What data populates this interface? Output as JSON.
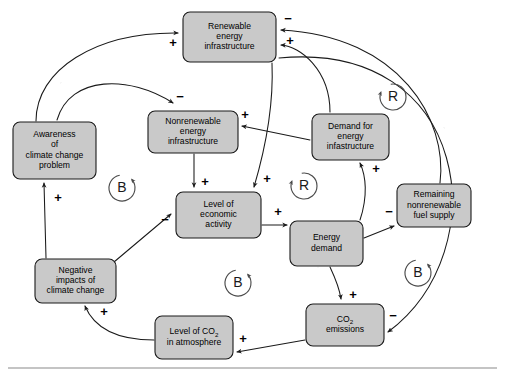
{
  "diagram": {
    "background_color": "#ffffff",
    "node_fill": "#c9c9c9",
    "node_stroke": "#1a1a1a",
    "link_color": "#1a1a1a",
    "loop_color": "#4a4a4a",
    "nodes": [
      {
        "id": "renewable",
        "lines": [
          "Renewable",
          "energy",
          "infrastructure"
        ],
        "x": 183,
        "y": 12,
        "w": 93,
        "h": 50
      },
      {
        "id": "awareness",
        "lines": [
          "Awareness",
          "of",
          "climate change",
          "problem"
        ],
        "x": 13,
        "y": 122,
        "w": 83,
        "h": 57
      },
      {
        "id": "nonrenewable",
        "lines": [
          "Nonrenewable",
          "energy",
          "infrastructure"
        ],
        "x": 148,
        "y": 111,
        "w": 90,
        "h": 42
      },
      {
        "id": "demand-infra",
        "lines": [
          "Demand for",
          "energy",
          "infastructure"
        ],
        "x": 312,
        "y": 114,
        "w": 77,
        "h": 46
      },
      {
        "id": "remaining-fuel",
        "lines": [
          "Remaining",
          "nonrenewable",
          "fuel supply"
        ],
        "x": 397,
        "y": 184,
        "w": 74,
        "h": 43
      },
      {
        "id": "economic",
        "lines": [
          "Level of",
          "economic",
          "activity"
        ],
        "x": 176,
        "y": 192,
        "w": 85,
        "h": 46
      },
      {
        "id": "energy-demand",
        "lines": [
          "Energy",
          "demand"
        ],
        "x": 290,
        "y": 221,
        "w": 73,
        "h": 45
      },
      {
        "id": "negative-impacts",
        "lines": [
          "Negative",
          "impacts of",
          "climate change"
        ],
        "x": 35,
        "y": 259,
        "w": 81,
        "h": 44
      },
      {
        "id": "co2-level",
        "lines": [
          "Level of CO|2|",
          "in atmosphere"
        ],
        "x": 155,
        "y": 316,
        "w": 78,
        "h": 43
      },
      {
        "id": "co2-emissions",
        "lines": [
          "CO|2|",
          "emissions"
        ],
        "x": 306,
        "y": 304,
        "w": 78,
        "h": 42
      }
    ],
    "links": [
      {
        "id": "awareness-to-renewable",
        "from": "awareness",
        "to": "renewable",
        "d": "M 36 121 C 36 70, 95 32, 178 33",
        "sign": "+",
        "sign_x": 173,
        "sign_y": 44
      },
      {
        "id": "awareness-to-nonrenewable",
        "from": "awareness",
        "to": "nonrenewable",
        "d": "M 57 120 C 70 75, 130 75, 173 103",
        "sign": "−",
        "sign_x": 180,
        "sign_y": 98
      },
      {
        "id": "nonrenewable-to-economic",
        "from": "nonrenewable",
        "to": "economic",
        "d": "M 194 154 L 194 187",
        "sign": "+",
        "sign_x": 205,
        "sign_y": 183
      },
      {
        "id": "renewable-to-economic",
        "from": "renewable",
        "to": "economic",
        "d": "M 272 63 C 274 110, 262 160, 254 187",
        "sign": "+",
        "sign_x": 267,
        "sign_y": 180
      },
      {
        "id": "economic-to-energydemand",
        "from": "economic",
        "to": "energy-demand",
        "d": "M 262 225 L 287 225",
        "sign": "+",
        "sign_x": 278,
        "sign_y": 213
      },
      {
        "id": "energydemand-to-demandinfra",
        "from": "energy-demand",
        "to": "demand-infra",
        "d": "M 360 220 C 368 196, 366 176, 360 163",
        "sign": "+",
        "sign_x": 376,
        "sign_y": 170
      },
      {
        "id": "demandinfra-to-nonrenewable",
        "from": "demand-infra",
        "to": "nonrenewable",
        "d": "M 310 140 L 242 126",
        "sign": "+",
        "sign_x": 245,
        "sign_y": 116
      },
      {
        "id": "demandinfra-to-renewable",
        "from": "demand-infra",
        "to": "renewable",
        "d": "M 330 112 C 330 70, 300 46, 281 45",
        "sign": "+",
        "sign_x": 290,
        "sign_y": 42
      },
      {
        "id": "energydemand-to-remainingfuel",
        "from": "energy-demand",
        "to": "remaining-fuel",
        "d": "M 364 238 L 394 226",
        "sign": "−",
        "sign_x": 389,
        "sign_y": 213
      },
      {
        "id": "remainingfuel-to-renewable",
        "from": "remaining-fuel",
        "to": "renewable",
        "d": "M 440 183 C 448 120, 400 36, 281 30",
        "sign": "−",
        "sign_x": 288,
        "sign_y": 20
      },
      {
        "id": "energydemand-to-co2emissions",
        "from": "energy-demand",
        "to": "co2-emissions",
        "d": "M 330 267 C 338 284, 340 292, 341 299",
        "sign": "+",
        "sign_x": 353,
        "sign_y": 296
      },
      {
        "id": "co2emissions-to-co2level",
        "from": "co2-emissions",
        "to": "co2-level",
        "d": "M 305 340 L 237 352",
        "sign": "+",
        "sign_x": 243,
        "sign_y": 340
      },
      {
        "id": "co2level-to-negativeimpacts",
        "from": "co2-level",
        "to": "negative-impacts",
        "d": "M 154 340 C 120 340, 95 330, 85 306",
        "sign": "+",
        "sign_x": 104,
        "sign_y": 313
      },
      {
        "id": "negativeimpacts-to-awareness",
        "from": "negative-impacts",
        "to": "awareness",
        "d": "M 46 258 L 44 183",
        "sign": "+",
        "sign_x": 58,
        "sign_y": 199
      },
      {
        "id": "negativeimpacts-to-economic",
        "from": "negative-impacts",
        "to": "economic",
        "d": "M 114 262 L 171 214",
        "sign": "−",
        "sign_x": 165,
        "sign_y": 221
      },
      {
        "id": "renewable-to-co2emissions",
        "from": "renewable",
        "to": "co2-emissions",
        "d": "M 279 58 C 470 40, 498 250, 388 332",
        "sign": "−",
        "sign_x": 393,
        "sign_y": 317
      }
    ],
    "loops": [
      {
        "id": "loop-b-awareness",
        "letter": "B",
        "cx": 122,
        "cy": 188,
        "direction": "counter-clockwise"
      },
      {
        "id": "loop-r-economic",
        "letter": "R",
        "cx": 304,
        "cy": 186,
        "direction": "clockwise"
      },
      {
        "id": "loop-r-demand",
        "letter": "R",
        "cx": 393,
        "cy": 97,
        "direction": "clockwise"
      },
      {
        "id": "loop-b-emissions",
        "letter": "B",
        "cx": 418,
        "cy": 273,
        "direction": "counter-clockwise"
      },
      {
        "id": "loop-b-center",
        "letter": "B",
        "cx": 238,
        "cy": 283,
        "direction": "counter-clockwise"
      }
    ],
    "footer_rule": {
      "y": 368,
      "x1": 8,
      "x2": 497
    }
  }
}
